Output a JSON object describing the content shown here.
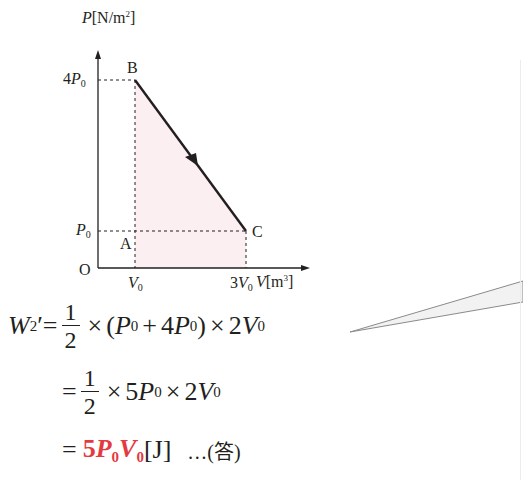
{
  "graph": {
    "y_axis_label": "P",
    "y_axis_unit": "[N/m",
    "y_axis_unit_sup": "2",
    "y_axis_unit_close": "]",
    "x_axis_label": "V",
    "x_axis_unit": "[m",
    "x_axis_unit_sup": "3",
    "x_axis_unit_close": "]",
    "origin_label": "O",
    "y_ticks": [
      {
        "coef": "4",
        "sym": "P",
        "sub": "0"
      },
      {
        "coef": "",
        "sym": "P",
        "sub": "0"
      }
    ],
    "x_ticks": [
      {
        "coef": "",
        "sym": "V",
        "sub": "0"
      },
      {
        "coef": "3",
        "sym": "V",
        "sub": "0"
      }
    ],
    "points": {
      "A": "A",
      "B": "B",
      "C": "C"
    },
    "colors": {
      "fill": "#fbeff2",
      "line": "#231f20",
      "dash": "#231f20"
    }
  },
  "equation": {
    "line1": {
      "lhs_sym": "W",
      "lhs_sub": "2",
      "lhs_prime": "′",
      "eq": "=",
      "num": "1",
      "den": "2",
      "times1": "×",
      "paren_open": "(",
      "p0a": "P",
      "p0a_sub": "0",
      "plus": "+",
      "coef4": "4",
      "p0b": "P",
      "p0b_sub": "0",
      "paren_close": ")",
      "times2": "×",
      "coef2": "2",
      "v0": "V",
      "v0_sub": "0"
    },
    "line2": {
      "eq": "=",
      "num": "1",
      "den": "2",
      "times1": "×",
      "coef5": "5",
      "p0": "P",
      "p0_sub": "0",
      "times2": "×",
      "coef2": "2",
      "v0": "V",
      "v0_sub": "0"
    },
    "line3": {
      "eq": "=",
      "coef5": "5",
      "p0": "P",
      "p0_sub": "0",
      "v0": "V",
      "v0_sub": "0",
      "unit": "[J]",
      "answer_mark": "…(答)",
      "highlight_color": "#e43a3f"
    }
  }
}
